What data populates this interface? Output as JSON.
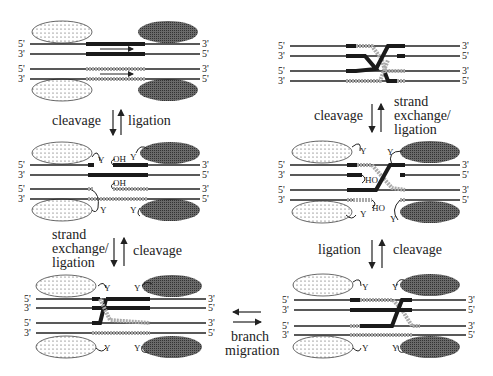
{
  "diagram": {
    "type": "reaction-scheme",
    "end_labels": {
      "five_prime": "5'",
      "three_prime": "3'"
    },
    "group_labels": {
      "hydroxyl_3": "OH",
      "hydroxyl_5": "HO",
      "tyrosine": "Y"
    },
    "steps": {
      "step1_to_2": {
        "forward": "cleavage",
        "reverse": "ligation"
      },
      "step2_to_3": {
        "forward_lines": [
          "strand",
          "exchange/",
          "ligation"
        ],
        "reverse": "cleavage"
      },
      "step3_to_4": {
        "lines": [
          "branch",
          "migration"
        ]
      },
      "step4_to_5": {
        "forward": "ligation",
        "reverse": "cleavage"
      },
      "step5_to_6": {
        "forward": "cleavage",
        "reverse_lines": [
          "strand",
          "exchange/",
          "ligation"
        ]
      }
    },
    "colors": {
      "strand": "#222222",
      "black_segment": "#1a1a1a",
      "gray_segment": "#aaaaaa",
      "light_protein": "#e8e8e8",
      "dark_protein": "#555555"
    }
  }
}
